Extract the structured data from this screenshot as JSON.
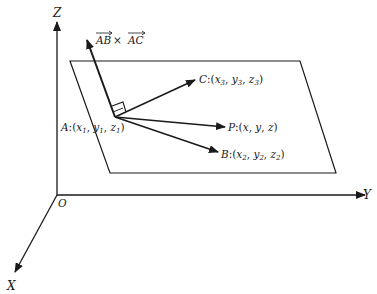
{
  "diagram": {
    "type": "3d-plane-normal-vector",
    "axes": {
      "z_label": "Z",
      "y_label": "Y",
      "x_label": "X",
      "origin_label": "O"
    },
    "normal_label": {
      "vec1": "AB",
      "op": " × ",
      "vec2": "AC"
    },
    "points": {
      "A": {
        "name": "A",
        "coords": [
          "x",
          "y",
          "z"
        ],
        "subscript": "1"
      },
      "C": {
        "name": "C",
        "coords": [
          "x",
          "y",
          "z"
        ],
        "subscript": "3"
      },
      "P": {
        "name": "P",
        "coords": [
          "x",
          "y",
          "z"
        ],
        "subscript": ""
      },
      "B": {
        "name": "B",
        "coords": [
          "x",
          "y",
          "z"
        ],
        "subscript": "2"
      }
    },
    "colors": {
      "line": "#1a1a1a",
      "background": "#ffffff"
    }
  }
}
